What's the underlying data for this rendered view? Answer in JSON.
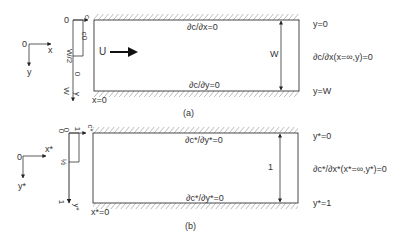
{
  "panel_a": {
    "caption": "(a)",
    "axes": {
      "origin": "0",
      "x": "x",
      "y": "y"
    },
    "inlet_profile": {
      "top_label": "0",
      "mid_label": "W/2",
      "bottom_label": "W",
      "value_label": "c0",
      "zero_label": "0",
      "c_axis": "c",
      "y_axis": "y"
    },
    "flow_label": "U",
    "top_bc": "∂c/∂x=0",
    "bottom_bc": "∂c/∂y=0",
    "width_label": "W",
    "y_top": "y=0",
    "y_bottom": "y=W",
    "outlet_bc": "∂c/∂x(x=∞,y)=0",
    "x_start": "x=0"
  },
  "panel_b": {
    "caption": "(b)",
    "axes": {
      "origin": "0",
      "x": "x*",
      "y": "y*"
    },
    "inlet_profile": {
      "top_label": "0",
      "top_label2": "0",
      "mid_label": "½",
      "bottom_label": "1",
      "value_label": "1",
      "c_axis": "c*",
      "y_axis": "y*"
    },
    "top_bc": "∂c*/∂y*=0",
    "bottom_bc": "∂c*/∂y*=0",
    "width_label": "1",
    "y_top": "y*=0",
    "y_bottom": "y*=1",
    "outlet_bc": "∂c*/∂x*(x*=∞,y*)=0",
    "x_start": "x*=0"
  },
  "colors": {
    "line": "#333333",
    "hatch": "#aaaaaa",
    "arrow": "#111111"
  }
}
